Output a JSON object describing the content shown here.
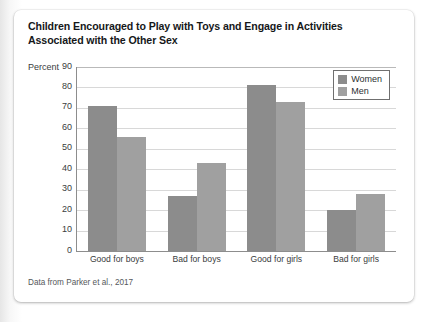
{
  "figure": {
    "title_line1": "Children Encouraged to Play with Toys and Engage in Activities",
    "title_line2": "Associated with the Other Sex",
    "source_note": "Data from Parker et al., 2017"
  },
  "legend": {
    "items": [
      {
        "label": "Women",
        "color": "#8c8c8c"
      },
      {
        "label": "Men",
        "color": "#a0a0a0"
      }
    ]
  },
  "axis": {
    "y_axis_label": "Percent",
    "y_ticks": [
      "90",
      "80",
      "70",
      "60",
      "50",
      "40",
      "30",
      "20",
      "10",
      "0"
    ]
  },
  "chart_data": {
    "type": "bar",
    "title": "Children Encouraged to Play with Toys and Engage in Activities Associated with the Other Sex",
    "subtitle": "",
    "xlabel": "",
    "ylabel": "Percent",
    "ylim": [
      0,
      90
    ],
    "ytick_step": 10,
    "grid": true,
    "legend_position": "top-right inside plot",
    "categories": [
      "Good for boys",
      "Bad for boys",
      "Good for girls",
      "Bad for girls"
    ],
    "series": [
      {
        "name": "Women",
        "color": "#8c8c8c",
        "values": [
          71,
          27,
          81,
          20
        ]
      },
      {
        "name": "Men",
        "color": "#a0a0a0",
        "values": [
          56,
          43,
          73,
          28
        ]
      }
    ],
    "annotations": [
      "Data from Parker et al., 2017"
    ]
  }
}
